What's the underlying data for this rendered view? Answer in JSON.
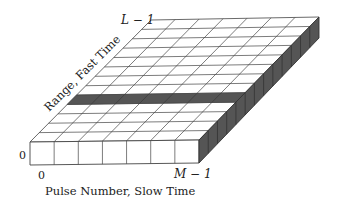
{
  "diagram": {
    "type": "radar-data-matrix",
    "grid": {
      "columns": 7,
      "rows": 13,
      "highlighted_row": 4
    },
    "colors": {
      "face_top": "#ffffff",
      "face_front": "#ffffff",
      "face_side": "#555555",
      "highlight": "#555555",
      "line": "#444444"
    },
    "labels": {
      "range_axis": "Range, Fast Time",
      "range_max": "L − 1",
      "range_min": "0",
      "pulse_axis": "Pulse Number,  Slow Time",
      "pulse_min": "0",
      "pulse_max": "M − 1"
    }
  }
}
